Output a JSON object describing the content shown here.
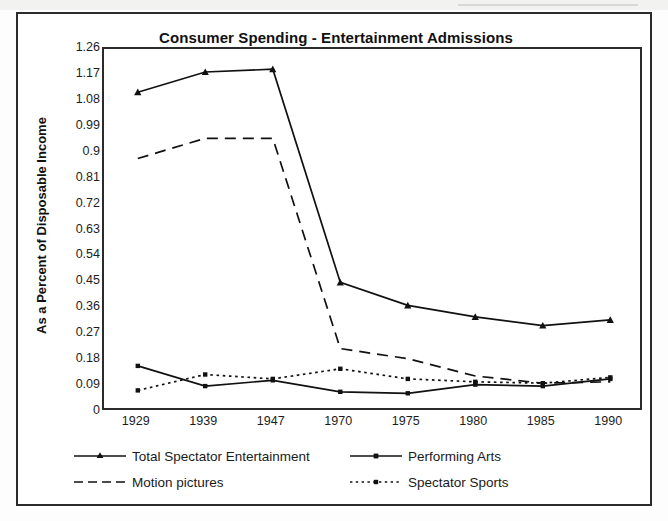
{
  "chart_data": {
    "type": "line",
    "title": "Consumer Spending - Entertainment Admissions",
    "xlabel": "",
    "ylabel": "As a Percent of Disposable Income",
    "categories": [
      "1929",
      "1939",
      "1947",
      "1970",
      "1975",
      "1980",
      "1985",
      "1990"
    ],
    "ylim": [
      0,
      1.26
    ],
    "yticks": [
      "1.26",
      "1.17",
      "1.08",
      "0.99",
      "0.9",
      "0.81",
      "0.72",
      "0.63",
      "0.54",
      "0.45",
      "0.36",
      "0.27",
      "0.18",
      "0.09",
      "0"
    ],
    "ytick_values": [
      1.26,
      1.17,
      1.08,
      0.99,
      0.9,
      0.81,
      0.72,
      0.63,
      0.54,
      0.45,
      0.36,
      0.27,
      0.18,
      0.09,
      0
    ],
    "grid": false,
    "legend_position": "bottom",
    "series": [
      {
        "name": "Total Spectator Entertainment",
        "values": [
          1.11,
          1.18,
          1.19,
          0.45,
          0.37,
          0.33,
          0.3,
          0.32
        ],
        "style": "solid",
        "marker": "triangle",
        "color": "#111111"
      },
      {
        "name": "Performing Arts",
        "values": [
          0.16,
          0.09,
          0.11,
          0.07,
          0.065,
          0.095,
          0.09,
          0.115
        ],
        "style": "solid",
        "marker": "square",
        "color": "#111111"
      },
      {
        "name": "Motion pictures",
        "values": [
          0.88,
          0.95,
          0.95,
          0.22,
          0.185,
          0.125,
          0.1,
          0.105
        ],
        "style": "dashed",
        "marker": "none",
        "color": "#111111"
      },
      {
        "name": "Spectator Sports",
        "values": [
          0.075,
          0.13,
          0.115,
          0.15,
          0.115,
          0.105,
          0.1,
          0.12
        ],
        "style": "dotted",
        "marker": "square",
        "color": "#111111"
      }
    ]
  },
  "legend": {
    "items": [
      {
        "label": "Total Spectator Entertainment"
      },
      {
        "label": "Performing Arts"
      },
      {
        "label": "Motion pictures"
      },
      {
        "label": "Spectator Sports"
      }
    ]
  }
}
